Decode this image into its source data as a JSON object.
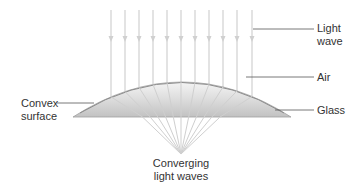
{
  "diagram": {
    "labels": {
      "light_wave": [
        "Light",
        "wave"
      ],
      "air": "Air",
      "glass": "Glass",
      "convex_surface": [
        "Convex",
        "surface"
      ],
      "converging": [
        "Converging",
        "light waves"
      ]
    },
    "colors": {
      "ray": "#d6d6d6",
      "lens_fill_top": "#f2f2f2",
      "lens_fill_bottom": "#c4c4c4",
      "lens_edge": "#9a9a9a",
      "leader_line": "#555555",
      "text": "#333333"
    },
    "rays": {
      "count": 11,
      "x_positions": [
        111,
        125,
        139,
        153,
        167,
        181,
        195,
        209,
        223,
        237,
        252
      ],
      "top_y": 10,
      "arrow_y": 40,
      "focus": [
        181,
        154
      ]
    },
    "lens": {
      "left_x": 73,
      "right_x": 291,
      "base_y": 117,
      "apex_y": 82
    }
  }
}
